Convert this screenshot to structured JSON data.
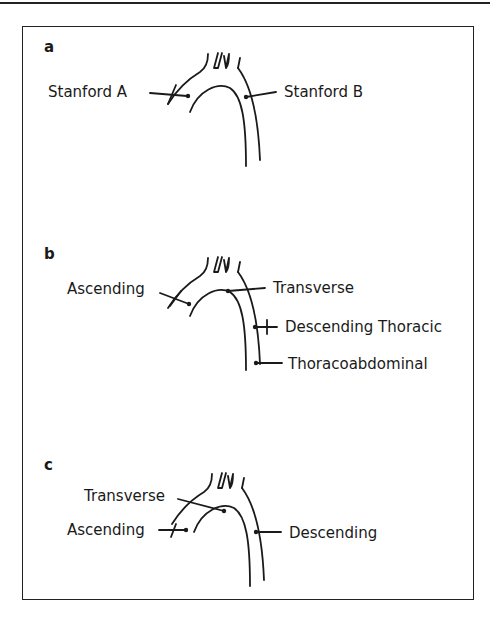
{
  "figure": {
    "panels": [
      {
        "id": "a",
        "label": "a",
        "labels": {
          "left": "Stanford A",
          "right": "Stanford B"
        }
      },
      {
        "id": "b",
        "label": "b",
        "labels": {
          "ascending": "Ascending",
          "transverse": "Transverse",
          "descending_thoracic": "Descending Thoracic",
          "thoracoabdominal": "Thoracoabdominal"
        }
      },
      {
        "id": "c",
        "label": "c",
        "labels": {
          "transverse": "Transverse",
          "ascending": "Ascending",
          "descending": "Descending"
        }
      }
    ]
  }
}
